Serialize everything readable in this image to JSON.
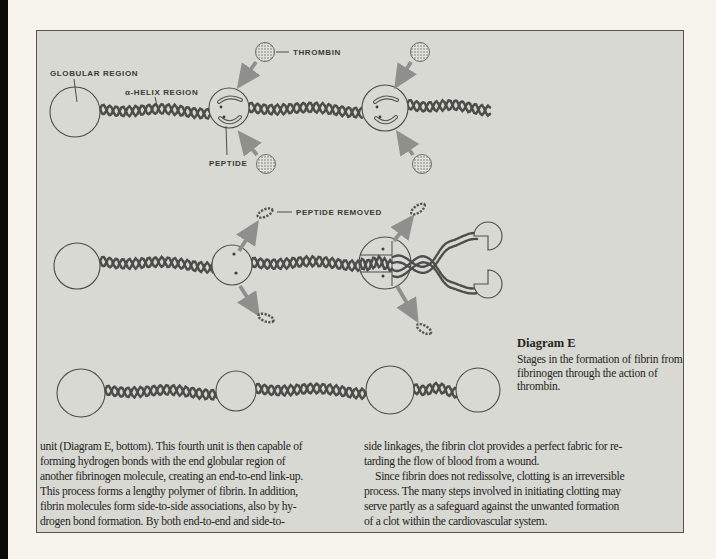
{
  "labels": {
    "globular_region": "GLOBULAR REGION",
    "alpha_helix_region": "α-HELIX REGION",
    "thrombin": "THROMBIN",
    "peptide": "PEPTIDE",
    "peptide_removed": "PEPTIDE REMOVED"
  },
  "caption": {
    "title": "Diagram E",
    "text": "Stages in the formation of fibrin from fibrinogen through the action of thrombin."
  },
  "body": {
    "left_lines": [
      "unit (Diagram E, bottom). This fourth unit is then capable of",
      "forming hydrogen bonds with the end globular region of",
      "another fibrinogen molecule, creating an end-to-end link-up.",
      "This process forms a lengthy polymer of fibrin. In addition,",
      "fibrin molecules form side-to-side associations, also by hy-",
      "drogen bond formation. By both end-to-end and side-to-"
    ],
    "right_lines": [
      "side linkages, the fibrin clot provides a perfect fabric for re-",
      "tarding the flow of blood from a wound.",
      "Since fibrin does not redissolve, clotting is an irreversible",
      "process. The many steps involved in initiating clotting may",
      "serve partly as a safeguard against the unwanted formation",
      "of a clot within the cardiovascular system."
    ]
  },
  "colors": {
    "page_bg": "#f7f4ee",
    "panel_bg": "#d9d9d4",
    "panel_border": "#55544e",
    "ink": "#4c4c48",
    "arrow_gray": "#8f8f8b",
    "body_text": "#1e1e1c"
  }
}
